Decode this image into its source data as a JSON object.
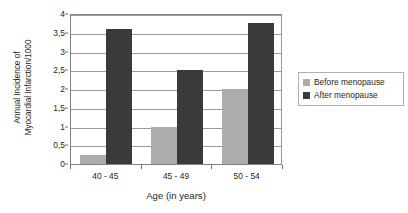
{
  "chart_data": {
    "type": "bar",
    "title": "",
    "categories": [
      "40 - 45",
      "45 - 49",
      "50 - 54"
    ],
    "series": [
      {
        "name": "Before menopause",
        "values": [
          0.25,
          1,
          2
        ],
        "color": "#acacac"
      },
      {
        "name": "After menopause",
        "values": [
          3.6,
          2.5,
          3.75
        ],
        "color": "#3a3a3a"
      }
    ],
    "xlabel": "Age (in years)",
    "ylabel_lines": [
      "Annual Incidence of",
      "Myocardial Infarction/1000"
    ],
    "ylabel": "Annual Incidence of Myocardial Infarction/1000",
    "ylim": [
      0,
      4
    ],
    "ytick_values": [
      0,
      0.5,
      1,
      1.5,
      2,
      2.5,
      3,
      3.5,
      4
    ],
    "ytick_labels": [
      "0",
      "0,5",
      "1",
      "1,5",
      "2",
      "2,5",
      "3",
      "3,5",
      "4"
    ],
    "grid": true,
    "legend_position": "right",
    "decimal_separator": ","
  },
  "legend": {
    "items": [
      {
        "label": "Before menopause",
        "color": "#acacac"
      },
      {
        "label": "After menopause",
        "color": "#3a3a3a"
      }
    ]
  },
  "axes": {
    "x_title": "Age (in years)",
    "y_title_line1": "Annual Incidence of",
    "y_title_line2": "Myocardial Infarction/1000"
  }
}
